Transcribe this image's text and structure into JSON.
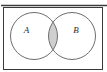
{
  "figure": {
    "type": "venn-diagram",
    "width": 107,
    "height": 72
  },
  "colors": {
    "page_background": "#ffffff",
    "frame_stroke": "#3a3a3a",
    "top_rule_stroke": "#3c3c3c",
    "circle_stroke": "#6e6e6e",
    "intersection_fill": "#cfcfcf",
    "intersection_stroke": "#7a7a7a",
    "label_text": "#2b2b2b"
  },
  "frame": {
    "name": "universal-set-rectangle",
    "x": 3.5,
    "y": 7.5,
    "width": 99,
    "height": 62,
    "stroke_width": 1
  },
  "top_rule": {
    "name": "top-horizontal-rule",
    "x1": 1,
    "x2": 107,
    "y": 5.5,
    "stroke_width": 1.6
  },
  "circles": [
    {
      "id": "set-a",
      "label": "A",
      "cx": 34,
      "cy": 36,
      "r": 23.5,
      "label_x": 26.5,
      "label_y": 33
    },
    {
      "id": "set-b",
      "label": "B",
      "cx": 72,
      "cy": 36,
      "r": 23.5,
      "label_x": 76,
      "label_y": 33
    }
  ],
  "intersection": {
    "name": "a-intersect-b-region",
    "shaded": true,
    "description": "lens shaped overlap region between circle A and circle B",
    "x_left": 48.5,
    "x_right": 57.5,
    "y_top": 16.7,
    "y_bottom": 55.3
  }
}
